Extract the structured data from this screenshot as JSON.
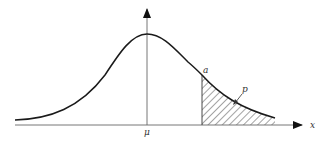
{
  "diagram": {
    "labels": {
      "mean": "μ",
      "threshold": "a",
      "tail_probability": "p",
      "x_axis": "x"
    },
    "colors": {
      "curve": "#1a1a1a",
      "axis": "#555555",
      "hatch": "#333333",
      "background": "#ffffff"
    }
  }
}
